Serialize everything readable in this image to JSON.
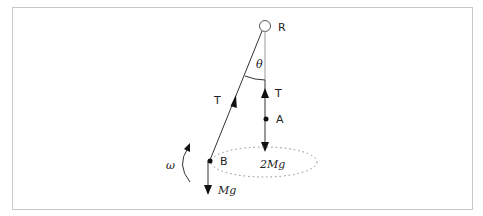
{
  "diagram": {
    "type": "physics-free-body",
    "labels": {
      "pivot": "R",
      "angle": "θ",
      "tension_left": "T",
      "tension_right": "T",
      "mass_a": "A",
      "mass_b": "B",
      "weight_b": "Mg",
      "weight_a": "2Mg",
      "angular_velocity": "ω"
    },
    "colors": {
      "line": "#333333",
      "vertical_line": "#999999",
      "frame": "#c8c8c8",
      "ellipse": "#888888"
    }
  }
}
